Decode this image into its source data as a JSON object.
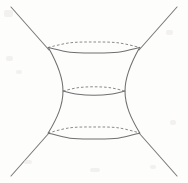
{
  "figure": {
    "title": "Hyperboloid of one sheet",
    "background_color": "#fdfdfc",
    "line_color": "#6f6f6f",
    "dashed_line_color": "#8a8a8a",
    "asymptote_color": "#7a7a7a",
    "width": 188,
    "height": 183,
    "labels": [],
    "elements": {
      "top_ellipse": {
        "name": "top-cross-section",
        "center_x": 94,
        "center_y": 47.5,
        "radius_x": 46,
        "radius_y": 5.5,
        "front_style": "solid",
        "back_style": "dashed"
      },
      "middle_ellipse": {
        "name": "waist-cross-section",
        "center_x": 94,
        "center_y": 91,
        "radius_x": 31,
        "radius_y": 4.2,
        "front_style": "solid",
        "back_style": "dashed"
      },
      "bottom_ellipse": {
        "name": "bottom-cross-section",
        "center_x": 94,
        "center_y": 133,
        "radius_x": 46,
        "radius_y": 6.0,
        "front_style": "solid",
        "back_style": "dashed"
      },
      "left_profile": {
        "name": "left-hyperbola-profile",
        "style": "solid"
      },
      "right_profile": {
        "name": "right-hyperbola-profile",
        "style": "solid"
      },
      "asymptotes": [
        {
          "name": "asymptote-top-left",
          "x1": 11,
          "y1": 7,
          "x2": 49,
          "y2": 50
        },
        {
          "name": "asymptote-top-right",
          "x1": 177,
          "y1": 7,
          "x2": 139,
          "y2": 50
        },
        {
          "name": "asymptote-bottom-left",
          "x1": 11,
          "y1": 176,
          "x2": 49,
          "y2": 133
        },
        {
          "name": "asymptote-bottom-right",
          "x1": 177,
          "y1": 176,
          "x2": 139,
          "y2": 133
        }
      ]
    }
  },
  "chart_data": {
    "type": "line",
    "title": "Hyperboloid of one sheet",
    "xlabel": "",
    "ylabel": "",
    "xlim": [
      0,
      188
    ],
    "ylim": [
      0,
      183
    ],
    "grid": false,
    "legend": "none",
    "annotations": [],
    "series": [
      {
        "name": "top-cross-section-front-arc",
        "style": "solid",
        "description": "Front (lower) half of the topmost circle seen in perspective",
        "points": [
          [
            48,
            47.5
          ],
          [
            70,
            52.2
          ],
          [
            94,
            53.0
          ],
          [
            118,
            52.2
          ],
          [
            140,
            47.5
          ]
        ]
      },
      {
        "name": "top-cross-section-back-arc",
        "style": "dashed",
        "description": "Rear (upper) half of the topmost circle seen in perspective",
        "points": [
          [
            48,
            47.5
          ],
          [
            70,
            42.8
          ],
          [
            94,
            42.0
          ],
          [
            118,
            42.8
          ],
          [
            140,
            47.5
          ]
        ]
      },
      {
        "name": "waist-cross-section-front-arc",
        "style": "solid",
        "description": "Front (lower) half of the narrow waist circle",
        "points": [
          [
            63,
            91.0
          ],
          [
            78,
            94.3
          ],
          [
            94,
            95.2
          ],
          [
            110,
            94.3
          ],
          [
            125,
            91.0
          ]
        ]
      },
      {
        "name": "waist-cross-section-back-arc",
        "style": "dashed",
        "description": "Rear (upper) half of the narrow waist circle",
        "points": [
          [
            63,
            91.0
          ],
          [
            78,
            87.7
          ],
          [
            94,
            86.8
          ],
          [
            110,
            87.7
          ],
          [
            125,
            91.0
          ]
        ]
      },
      {
        "name": "bottom-cross-section-front-arc",
        "style": "solid",
        "description": "Front (lower) half of the bottom circle",
        "points": [
          [
            48,
            133.0
          ],
          [
            70,
            138.2
          ],
          [
            94,
            139.0
          ],
          [
            118,
            138.2
          ],
          [
            140,
            133.0
          ]
        ]
      },
      {
        "name": "bottom-cross-section-back-arc",
        "style": "dashed",
        "description": "Rear (upper) half of the bottom circle",
        "points": [
          [
            48,
            133.0
          ],
          [
            70,
            127.8
          ],
          [
            94,
            127.0
          ],
          [
            118,
            127.8
          ],
          [
            140,
            133.0
          ]
        ]
      },
      {
        "name": "left-profile-curve",
        "style": "solid",
        "description": "Left hyperbolic generating curve from top rim to bottom rim, pinching inward at the waist",
        "points": [
          [
            48,
            47.5
          ],
          [
            55,
            60
          ],
          [
            60,
            73
          ],
          [
            63,
            86
          ],
          [
            63,
            96
          ],
          [
            60,
            109
          ],
          [
            55,
            122
          ],
          [
            48,
            133
          ]
        ]
      },
      {
        "name": "right-profile-curve",
        "style": "solid",
        "description": "Right hyperbolic generating curve from top rim to bottom rim, pinching inward at the waist",
        "points": [
          [
            140,
            47.5
          ],
          [
            133,
            60
          ],
          [
            128,
            73
          ],
          [
            125,
            86
          ],
          [
            125,
            96
          ],
          [
            128,
            109
          ],
          [
            133,
            122
          ],
          [
            140,
            133
          ]
        ]
      },
      {
        "name": "asymptote-top-left",
        "style": "solid",
        "description": "Straight line from the top-left corner to the left end of the top circle",
        "points": [
          [
            11,
            7
          ],
          [
            49,
            50
          ]
        ]
      },
      {
        "name": "asymptote-top-right",
        "style": "solid",
        "description": "Straight line from the top-right corner to the right end of the top circle",
        "points": [
          [
            177,
            7
          ],
          [
            139,
            50
          ]
        ]
      },
      {
        "name": "asymptote-bottom-left",
        "style": "solid",
        "description": "Straight line from the bottom-left corner to the left end of the bottom circle",
        "points": [
          [
            11,
            176
          ],
          [
            49,
            133
          ]
        ]
      },
      {
        "name": "asymptote-bottom-right",
        "style": "solid",
        "description": "Straight line from the bottom-right corner to the right end of the bottom circle",
        "points": [
          [
            177,
            176
          ],
          [
            139,
            133
          ]
        ]
      }
    ]
  }
}
